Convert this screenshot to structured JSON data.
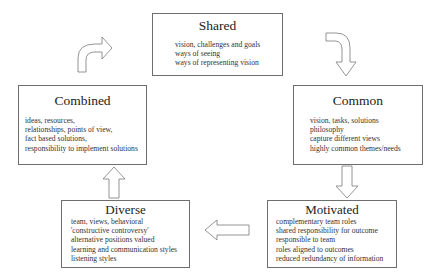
{
  "diagram": {
    "nodes": [
      {
        "id": "shared",
        "title": "Shared",
        "items": [
          "vision, challenges and goals",
          "ways of seeing",
          "ways of representing vision"
        ]
      },
      {
        "id": "common",
        "title": "Common",
        "items": [
          "vision, tasks, solutions",
          "philosophy",
          "capture different views",
          "highly common themes/needs"
        ]
      },
      {
        "id": "motivated",
        "title": "Motivated",
        "items": [
          "complementary team roles",
          "shared responsibility for outcome",
          "responsible to team",
          "roles aligned to outcomes",
          "reduced redundancy of information"
        ]
      },
      {
        "id": "diverse",
        "title": "Diverse",
        "items": [
          "team, views, behavioral",
          "'constructive controversy'",
          "alternative positions valued",
          "learning and communication styles",
          "listening styles"
        ]
      },
      {
        "id": "combined",
        "title": "Combined",
        "items": [
          "ideas, resources,",
          "relationships, points of view,",
          "fact based solutions,",
          "responsibility to implement solutions"
        ]
      }
    ],
    "edges": [
      {
        "from": "shared",
        "to": "common",
        "shape": "curved-arrow-down-right"
      },
      {
        "from": "common",
        "to": "motivated",
        "shape": "down-arrow"
      },
      {
        "from": "motivated",
        "to": "diverse",
        "shape": "left-arrow"
      },
      {
        "from": "diverse",
        "to": "combined",
        "shape": "up-arrow"
      },
      {
        "from": "combined",
        "to": "shared",
        "shape": "curved-arrow-up-right"
      }
    ],
    "colors": {
      "border": "#6e6e6e",
      "text": "#333333",
      "background": "#ffffff"
    }
  }
}
